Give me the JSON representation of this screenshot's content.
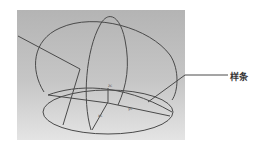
{
  "figure": {
    "callout_label": "样条",
    "axis_labels": {
      "z": "zc",
      "x": "xc",
      "y": "yc"
    },
    "colors": {
      "line": "#4a4a4a",
      "panel_top": "#b4b4b4",
      "panel_bottom": "#e4e4e4"
    }
  }
}
